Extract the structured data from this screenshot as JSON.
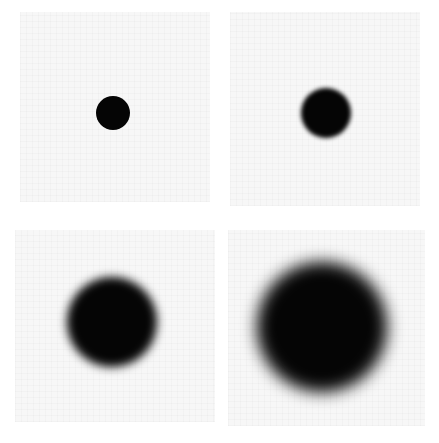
{
  "figure": {
    "layout": "2x2 grid",
    "background_color": "#ffffff",
    "panel_color": "#f7f7f7",
    "disc_color": "#050505",
    "panels": [
      {
        "id": "top-left",
        "left": 20,
        "top": 12,
        "width": 190,
        "height": 190,
        "disc_cx": 113,
        "disc_cy": 113,
        "disc_radius": 17,
        "blur_px": 0.6
      },
      {
        "id": "top-right",
        "left": 230,
        "top": 12,
        "width": 190,
        "height": 194,
        "disc_cx": 326,
        "disc_cy": 113,
        "disc_radius": 25,
        "blur_px": 2
      },
      {
        "id": "bottom-left",
        "left": 15,
        "top": 230,
        "width": 200,
        "height": 192,
        "disc_cx": 112,
        "disc_cy": 322,
        "disc_radius": 45,
        "blur_px": 5
      },
      {
        "id": "bottom-right",
        "left": 228,
        "top": 230,
        "width": 197,
        "height": 196,
        "disc_cx": 322,
        "disc_cy": 327,
        "disc_radius": 65,
        "blur_px": 8
      }
    ]
  }
}
